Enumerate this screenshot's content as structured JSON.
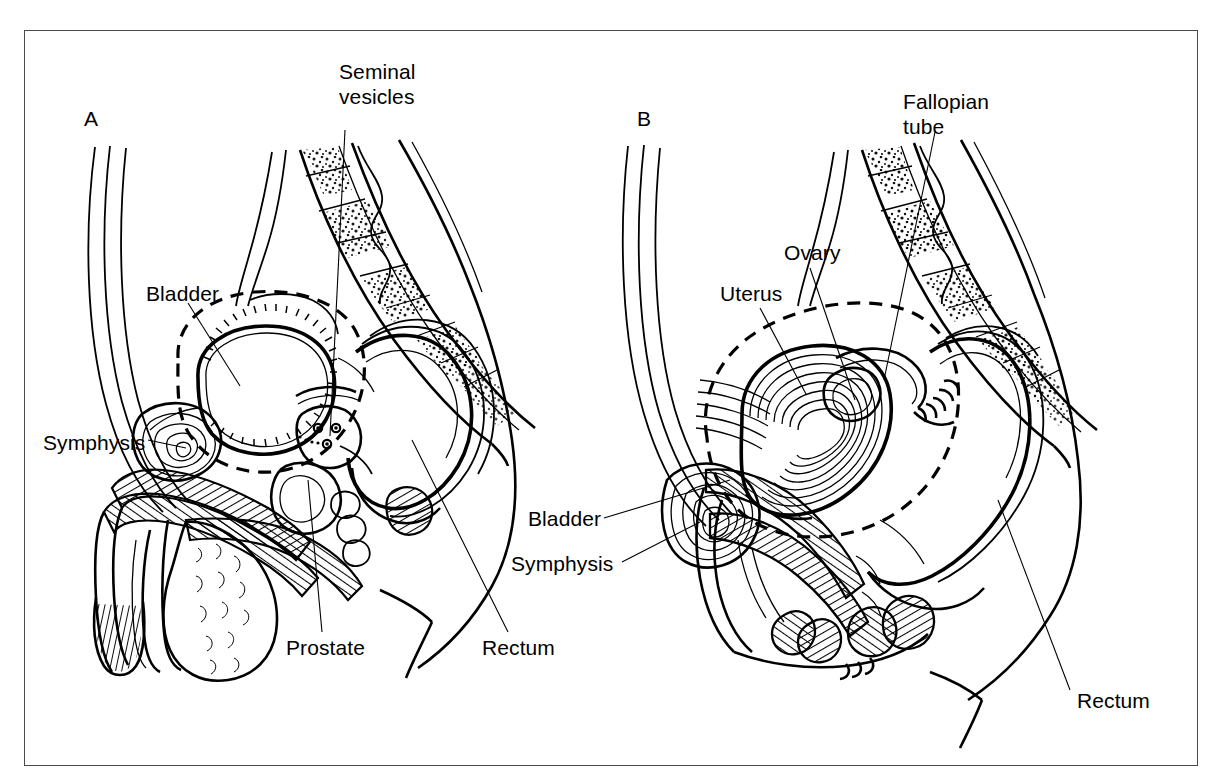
{
  "figure": {
    "type": "anatomical-line-diagram",
    "background_color": "#ffffff",
    "line_color": "#000000",
    "frame_color": "#4a4a4a"
  },
  "panels": [
    {
      "id": "A",
      "letter": "A",
      "subject": "male pelvis midsagittal section",
      "labels": [
        {
          "key": "seminal_vesicles",
          "text_line1": "Seminal",
          "text_line2": "vesicles"
        },
        {
          "key": "bladder",
          "text": "Bladder"
        },
        {
          "key": "symphysis",
          "text": "Symphysis"
        },
        {
          "key": "prostate",
          "text": "Prostate"
        },
        {
          "key": "rectum",
          "text": "Rectum"
        }
      ]
    },
    {
      "id": "B",
      "letter": "B",
      "subject": "female pelvis midsagittal section",
      "labels": [
        {
          "key": "fallopian_tube",
          "text_line1": "Fallopian",
          "text_line2": "tube"
        },
        {
          "key": "ovary",
          "text": "Ovary"
        },
        {
          "key": "uterus",
          "text": "Uterus"
        },
        {
          "key": "bladder",
          "text": "Bladder"
        },
        {
          "key": "symphysis",
          "text": "Symphysis"
        },
        {
          "key": "rectum",
          "text": "Rectum"
        }
      ]
    }
  ],
  "text": {
    "a_letter": "A",
    "b_letter": "B",
    "seminal_l1": "Seminal",
    "seminal_l2": "vesicles",
    "a_bladder": "Bladder",
    "a_symphysis": "Symphysis",
    "a_prostate": "Prostate",
    "a_rectum": "Rectum",
    "fallopian_l1": "Fallopian",
    "fallopian_l2": "tube",
    "b_ovary": "Ovary",
    "b_uterus": "Uterus",
    "b_bladder": "Bladder",
    "b_symphysis": "Symphysis",
    "b_rectum": "Rectum"
  }
}
